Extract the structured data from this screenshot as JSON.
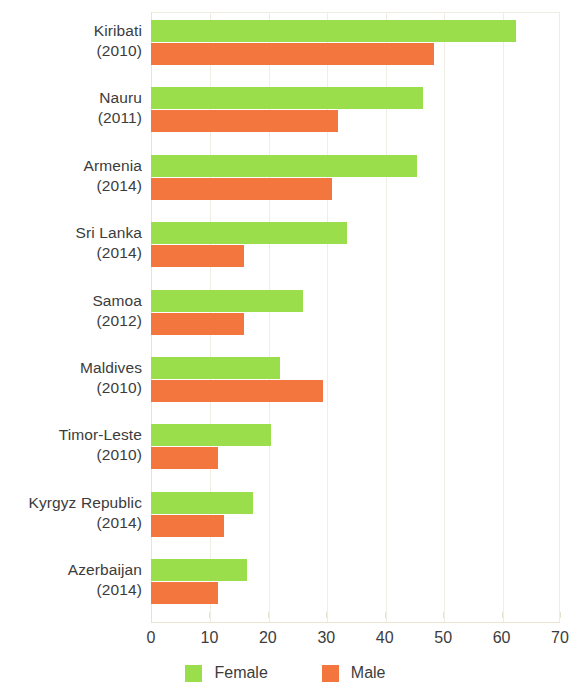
{
  "chart_data": {
    "type": "bar",
    "orientation": "horizontal",
    "title": "",
    "subtitle": "",
    "xlabel": "",
    "ylabel": "",
    "xlim": [
      0,
      70
    ],
    "xticks": [
      0,
      10,
      20,
      30,
      40,
      50,
      60,
      70
    ],
    "grid": true,
    "legend_position": "bottom",
    "categories": [
      "Kiribati (2010)",
      "Nauru (2011)",
      "Armenia (2014)",
      "Sri Lanka (2014)",
      "Samoa (2012)",
      "Maldives (2010)",
      "Timor-Leste (2010)",
      "Kyrgyz Republic (2014)",
      "Azerbaijan (2014)"
    ],
    "category_names": [
      "Kiribati",
      "Nauru",
      "Armenia",
      "Sri Lanka",
      "Samoa",
      "Maldives",
      "Timor-Leste",
      "Kyrgyz Republic",
      "Azerbaijan"
    ],
    "category_years": [
      "(2010)",
      "(2011)",
      "(2014)",
      "(2014)",
      "(2012)",
      "(2010)",
      "(2010)",
      "(2014)",
      "(2014)"
    ],
    "series": [
      {
        "name": "Female",
        "color": "#9ade4b",
        "values": [
          62.5,
          46.5,
          45.5,
          33.5,
          26,
          22,
          20.5,
          17.5,
          16.5
        ]
      },
      {
        "name": "Male",
        "color": "#f4763f",
        "values": [
          48.5,
          32,
          31,
          16,
          16,
          29.5,
          11.5,
          12.5,
          11.5
        ]
      }
    ]
  },
  "legend": {
    "items": [
      {
        "label": "Female",
        "color": "#9ade4b"
      },
      {
        "label": "Male",
        "color": "#f4763f"
      }
    ]
  },
  "axis": {
    "tick_labels": [
      "0",
      "10",
      "20",
      "30",
      "40",
      "50",
      "60",
      "70"
    ]
  },
  "colors": {
    "female": "#9ade4b",
    "male": "#f4763f",
    "grid": "#f0ede2",
    "axis_text": "#3c3c3c",
    "background": "#ffffff"
  }
}
